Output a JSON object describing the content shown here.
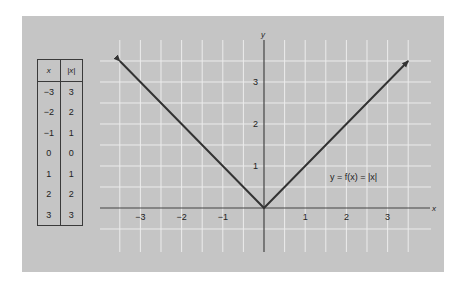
{
  "chart_data": {
    "type": "line",
    "title": "",
    "function_label": "y = f(x) = |x|",
    "xlabel": "x",
    "ylabel": "y",
    "x": [
      -3.5,
      -3,
      -2,
      -1,
      0,
      1,
      2,
      3,
      3.5
    ],
    "series": [
      {
        "name": "y = |x|",
        "values": [
          3.5,
          3,
          2,
          1,
          0,
          1,
          2,
          3,
          3.5
        ]
      }
    ],
    "x_ticks": [
      "−3",
      "−2",
      "−1",
      "1",
      "2",
      "3"
    ],
    "y_ticks": [
      "1",
      "2",
      "3"
    ],
    "xlim": [
      -3.5,
      4
    ],
    "ylim": [
      -1,
      4
    ],
    "grid": true,
    "grid_step": 0.5,
    "arrows_on_ends": true,
    "table": {
      "headers": [
        "x",
        "|x|"
      ],
      "rows": [
        [
          "−3",
          "3"
        ],
        [
          "−2",
          "2"
        ],
        [
          "−1",
          "1"
        ],
        [
          "0",
          "0"
        ],
        [
          "1",
          "1"
        ],
        [
          "2",
          "2"
        ],
        [
          "3",
          "3"
        ]
      ]
    }
  },
  "colors": {
    "panel": "#c5c5c5",
    "grid": "#ececec",
    "line": "#333333",
    "background": "#ffffff"
  }
}
